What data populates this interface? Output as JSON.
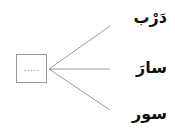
{
  "diagram": {
    "center_box": {
      "placeholder": "....."
    },
    "words": [
      {
        "text": "دَرْب"
      },
      {
        "text": "سارَ"
      },
      {
        "text": "سور"
      }
    ],
    "line_color": "#9a9a9a"
  }
}
